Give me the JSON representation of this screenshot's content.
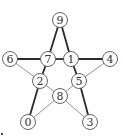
{
  "diagram": {
    "type": "graph",
    "nodes": [
      {
        "id": "0",
        "label": "0",
        "x": 28,
        "y": 122
      },
      {
        "id": "1",
        "label": "1",
        "x": 71,
        "y": 59
      },
      {
        "id": "2",
        "label": "2",
        "x": 40,
        "y": 81
      },
      {
        "id": "3",
        "label": "3",
        "x": 90,
        "y": 122
      },
      {
        "id": "4",
        "label": "4",
        "x": 110,
        "y": 59
      },
      {
        "id": "5",
        "label": "5",
        "x": 79,
        "y": 81
      },
      {
        "id": "6",
        "label": "6",
        "x": 10,
        "y": 59
      },
      {
        "id": "7",
        "label": "7",
        "x": 48,
        "y": 59
      },
      {
        "id": "8",
        "label": "8",
        "x": 60,
        "y": 96
      },
      {
        "id": "9",
        "label": "9",
        "x": 60,
        "y": 20
      }
    ],
    "edges": [
      {
        "from": "9",
        "to": "7",
        "weight": "thick"
      },
      {
        "from": "9",
        "to": "1",
        "weight": "thick"
      },
      {
        "from": "6",
        "to": "7",
        "weight": "thick"
      },
      {
        "from": "7",
        "to": "1",
        "weight": "thick"
      },
      {
        "from": "1",
        "to": "4",
        "weight": "thick"
      },
      {
        "from": "7",
        "to": "2",
        "weight": "thick"
      },
      {
        "from": "1",
        "to": "5",
        "weight": "thick"
      },
      {
        "from": "2",
        "to": "0",
        "weight": "thick"
      },
      {
        "from": "5",
        "to": "3",
        "weight": "thick"
      },
      {
        "from": "6",
        "to": "2",
        "weight": "thin"
      },
      {
        "from": "4",
        "to": "5",
        "weight": "thin"
      },
      {
        "from": "2",
        "to": "8",
        "weight": "thin"
      },
      {
        "from": "5",
        "to": "8",
        "weight": "thin"
      },
      {
        "from": "8",
        "to": "0",
        "weight": "thin"
      },
      {
        "from": "8",
        "to": "3",
        "weight": "thin"
      }
    ]
  }
}
